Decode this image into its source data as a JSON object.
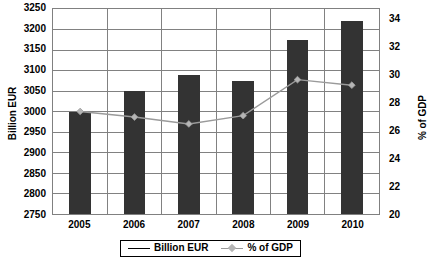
{
  "chart_data": {
    "type": "bar",
    "title": "",
    "subtitle": "",
    "xlabel": "",
    "ylabel": "Billion EUR",
    "y2label": "% of GDP",
    "categories": [
      "2005",
      "2006",
      "2007",
      "2008",
      "2009",
      "2010"
    ],
    "grid": true,
    "legend_position": "bottom",
    "ylim": [
      2750,
      3250
    ],
    "ytick_step": 50,
    "yticks": [
      "3250",
      "3200",
      "3150",
      "3100",
      "3050",
      "3000",
      "2950",
      "2900",
      "2850",
      "2800",
      "2750"
    ],
    "y2lim": [
      20,
      34.8
    ],
    "y2tick_step": 2,
    "y2ticks": [
      "34",
      "32",
      "30",
      "28",
      "26",
      "24",
      "22",
      "20"
    ],
    "series": [
      {
        "name": "Billion EUR",
        "type": "bar",
        "axis": "left",
        "color": "#333333",
        "values": [
          3000,
          3050,
          3090,
          3075,
          3175,
          3220
        ]
      },
      {
        "name": "% of GDP",
        "type": "line",
        "axis": "right",
        "color": "#9a9a9a",
        "marker": "diamond",
        "marker_color": "#b5b5b5",
        "values": [
          27.4,
          27.0,
          26.5,
          27.1,
          29.7,
          29.3
        ]
      }
    ]
  },
  "legend": {
    "items": [
      {
        "label": "Billion EUR",
        "swatch": "line-black",
        "color": "#000000"
      },
      {
        "label": "% of GDP",
        "swatch": "line-diamond-gray",
        "color": "#9a9a9a"
      }
    ]
  },
  "colors": {
    "bar": "#333333",
    "line": "#9a9a9a",
    "marker": "#b5b5b5",
    "grid": "#808080",
    "frame": "#808080",
    "axis_text": "#000000",
    "background": "#ffffff"
  }
}
